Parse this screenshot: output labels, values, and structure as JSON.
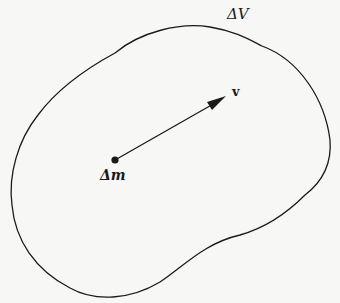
{
  "diagram": {
    "region_label": "ΔV",
    "mass_label": "Δm",
    "velocity_label": "v",
    "colors": {
      "stroke": "#1a1a1a",
      "background": "#f7f7f5"
    }
  }
}
